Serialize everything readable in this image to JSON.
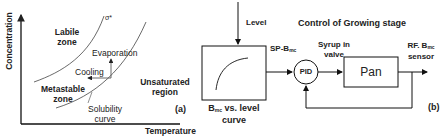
{
  "panel_a": {
    "tag": "(a)",
    "x_axis_label": "Temperature",
    "y_axis_label": "Concentration",
    "supersolubility_label": "σ*",
    "zones": {
      "labile_line1": "Labile",
      "labile_line2": "zone",
      "metastable_line1": "Metastable",
      "metastable_line2": "zone",
      "unsaturated_line1": "Unsaturated",
      "unsaturated_line2": "region"
    },
    "arrows": {
      "evaporation": "Evaporation",
      "cooling": "Cooling"
    },
    "solubility_line1": "Solubility",
    "solubility_line2": "curve"
  },
  "panel_b": {
    "tag": "(b)",
    "title": "Control of Growing stage",
    "level_label": "Level",
    "setpoint_label": "SP-B",
    "setpoint_sub": "mc",
    "curve_block_label_main": "B",
    "curve_block_label_sub": "mc",
    "curve_block_label_rest": " vs. level",
    "curve_block_label_line2": "curve",
    "pid_label": "PID",
    "valve_line1": "Syrup in",
    "valve_line2": "valve",
    "pan_label": "Pan",
    "sensor_line1_main": "RF.  B",
    "sensor_line1_sub": "mc",
    "sensor_line2": "sensor"
  }
}
